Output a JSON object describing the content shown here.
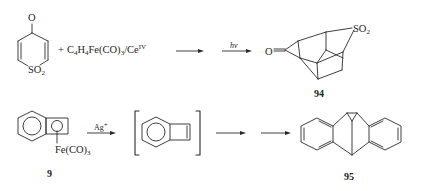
{
  "scheme": {
    "row1": {
      "reactant": {
        "name": "4H-thiopyran-4-one-1,1-dioxide",
        "labels": {
          "oxygen": "O",
          "sulfonyl": "SO",
          "sulfonyl_sub": "2"
        }
      },
      "reagent": {
        "plus": "+",
        "text_parts": [
          "C",
          "4",
          "H",
          "4",
          "Fe(CO)",
          "3",
          "/Ce",
          "IV"
        ]
      },
      "arrow1_label": "",
      "arrow2_label": "hν",
      "product": {
        "labels": {
          "oxygen": "O",
          "sulfonyl": "SO",
          "sulfonyl_sub": "2"
        },
        "compound_number": "94"
      }
    },
    "row2": {
      "reactant": {
        "labels": {
          "iron": "Fe(CO)",
          "iron_sub": "3"
        },
        "compound_number": "9"
      },
      "arrow1_label": "Ag",
      "arrow1_label_sup": "+",
      "intermediate": {
        "name": "benzocyclobutadiene",
        "bracketed": true
      },
      "arrow2_label": "",
      "arrow3_label": "",
      "product": {
        "compound_number": "95"
      }
    }
  }
}
